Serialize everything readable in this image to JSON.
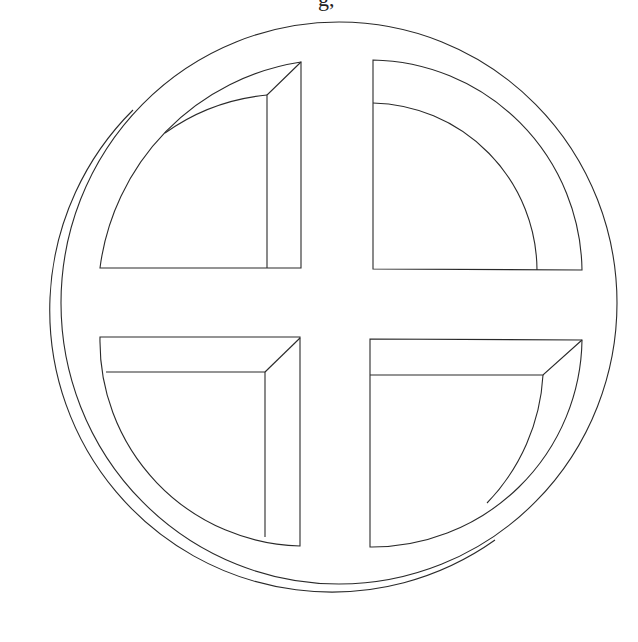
{
  "text_fragment": "g,",
  "figure": {
    "stroke_color": "#2a2a2a",
    "background": "#ffffff",
    "front_ring": {
      "cx": 339,
      "cy": 303,
      "rx": 278,
      "ry": 281
    },
    "back_ring_visible_arc": {
      "cx": 302,
      "cy": 338,
      "r": 282
    },
    "quadrants": [
      "top-left",
      "top-right",
      "bottom-left",
      "bottom-right"
    ]
  }
}
